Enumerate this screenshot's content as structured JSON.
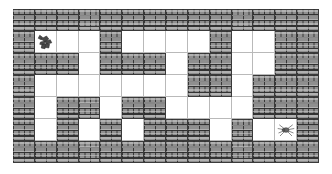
{
  "app": {
    "title": "Brick Maze",
    "background_color": "#ffffff"
  },
  "maze": {
    "columns": 14,
    "rows": 7,
    "cell_width_px": 21.9,
    "cell_height_px": 22.0,
    "wall_color": "#8f8f8f",
    "mortar_color": "#3a3a3a",
    "open_color": "#ffffff",
    "grid_line_color": "#b9b9b9",
    "legend": {
      "wall_label": "brick wall",
      "open_label": "open path",
      "start_label": "player",
      "goal_label": "spider"
    },
    "layout": [
      "WWWWWWWWWWWWWW",
      "W...W....W..WW",
      "WWW.WWW.WW..WW",
      "W.......WW.WWW",
      "W.WW.WW....WWW",
      "W.W.W.WWW.W..W",
      "WWWWWWWWWWWWWW"
    ],
    "start": {
      "row": 1,
      "col": 1,
      "sprite": "player-creature-icon"
    },
    "goal": {
      "row": 5,
      "col": 12,
      "sprite": "spider-icon"
    }
  }
}
